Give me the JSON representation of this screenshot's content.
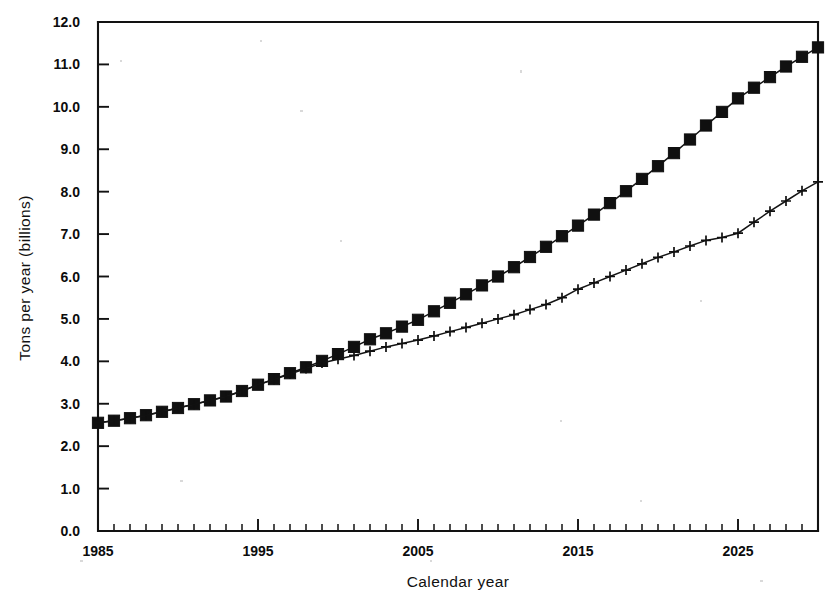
{
  "chart_data": {
    "type": "line",
    "title": "",
    "subtitle": "",
    "xlabel": "Calendar year",
    "ylabel": "Tons per year (billions)",
    "xlim": [
      1985,
      2030
    ],
    "ylim": [
      0.0,
      12.0
    ],
    "grid": false,
    "legend": null,
    "x_major_ticks": [
      1985,
      1995,
      2005,
      2015,
      2025
    ],
    "x_major_tick_labels": [
      "1985",
      "1995",
      "2005",
      "2015",
      "2025"
    ],
    "x_minor_tick_step": 1,
    "y_ticks": [
      0.0,
      1.0,
      2.0,
      3.0,
      4.0,
      5.0,
      6.0,
      7.0,
      8.0,
      9.0,
      10.0,
      11.0,
      12.0
    ],
    "y_tick_labels": [
      "0.0",
      "1.0",
      "2.0",
      "3.0",
      "4.0",
      "5.0",
      "6.0",
      "7.0",
      "8.0",
      "9.0",
      "10.0",
      "11.0",
      "12.0"
    ],
    "x": [
      1985,
      1986,
      1987,
      1988,
      1989,
      1990,
      1991,
      1992,
      1993,
      1994,
      1995,
      1996,
      1997,
      1998,
      1999,
      2000,
      2001,
      2002,
      2003,
      2004,
      2005,
      2006,
      2007,
      2008,
      2009,
      2010,
      2011,
      2012,
      2013,
      2014,
      2015,
      2016,
      2017,
      2018,
      2019,
      2020,
      2021,
      2022,
      2023,
      2024,
      2025,
      2026,
      2027,
      2028,
      2029,
      2030
    ],
    "series": [
      {
        "name": "upper-series",
        "marker": "filled-square",
        "values": [
          2.55,
          2.6,
          2.66,
          2.73,
          2.81,
          2.9,
          2.99,
          3.08,
          3.17,
          3.3,
          3.45,
          3.58,
          3.72,
          3.86,
          4.01,
          4.17,
          4.34,
          4.52,
          4.66,
          4.82,
          4.98,
          5.18,
          5.38,
          5.58,
          5.79,
          6.0,
          6.22,
          6.46,
          6.7,
          6.95,
          7.2,
          7.46,
          7.73,
          8.01,
          8.3,
          8.6,
          8.91,
          9.23,
          9.56,
          9.88,
          10.2,
          10.45,
          10.7,
          10.95,
          11.18,
          11.4
        ]
      },
      {
        "name": "lower-series",
        "marker": "plus",
        "values": [
          2.55,
          2.6,
          2.66,
          2.73,
          2.81,
          2.9,
          2.99,
          3.08,
          3.17,
          3.3,
          3.45,
          3.57,
          3.7,
          3.83,
          3.96,
          4.05,
          4.14,
          4.24,
          4.34,
          4.42,
          4.5,
          4.6,
          4.7,
          4.8,
          4.9,
          5.0,
          5.1,
          5.22,
          5.34,
          5.5,
          5.7,
          5.85,
          6.0,
          6.15,
          6.3,
          6.45,
          6.58,
          6.72,
          6.85,
          6.92,
          7.02,
          7.28,
          7.54,
          7.78,
          8.02,
          8.23
        ]
      }
    ]
  }
}
